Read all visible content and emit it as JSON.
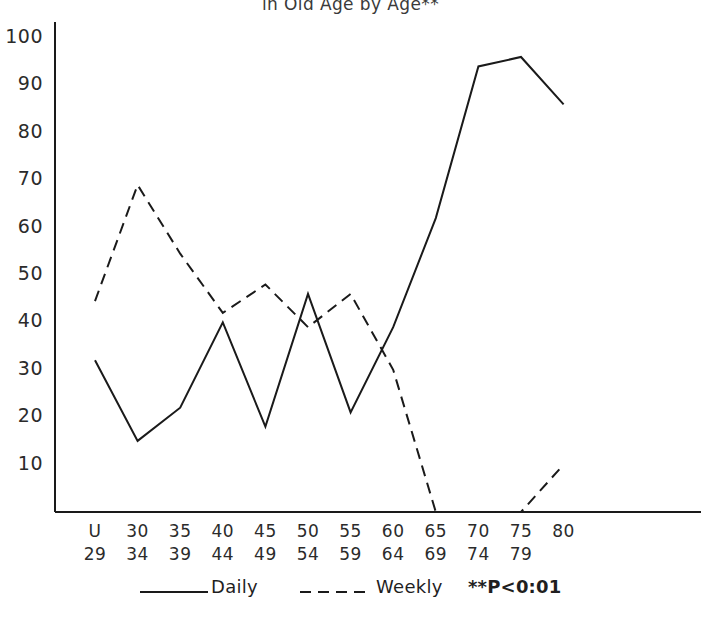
{
  "chart_data": {
    "type": "line",
    "title": "in Old Age by Age**",
    "xlabel": "",
    "ylabel": "",
    "ylim": [
      0,
      105
    ],
    "yticks": [
      10,
      20,
      30,
      40,
      50,
      60,
      70,
      80,
      90,
      100
    ],
    "grid": false,
    "legend_position": "bottom",
    "categories": [
      "U\n29",
      "30\n34",
      "35\n39",
      "40\n44",
      "45\n49",
      "50\n54",
      "55\n59",
      "60\n64",
      "65\n69",
      "70\n74",
      "75\n79",
      "80"
    ],
    "category_top": [
      "U",
      "30",
      "35",
      "40",
      "45",
      "50",
      "55",
      "60",
      "65",
      "70",
      "75",
      ""
    ],
    "category_bottom": [
      "29",
      "34",
      "39",
      "44",
      "49",
      "54",
      "59",
      "64",
      "69",
      "74",
      "79",
      "80"
    ],
    "series": [
      {
        "name": "Daily",
        "style": "solid",
        "color": "#1a1a1a",
        "values": [
          32,
          15,
          22,
          40,
          18,
          46,
          21,
          39,
          62,
          94,
          96,
          86
        ]
      },
      {
        "name": "Weekly",
        "style": "dashed",
        "color": "#1a1a1a",
        "values": [
          44.5,
          69,
          54.5,
          42,
          48,
          39,
          46,
          30,
          0,
          0,
          0,
          10
        ]
      }
    ],
    "annotations": [
      {
        "id": "significance-note",
        "text": "**P<0:01"
      }
    ]
  },
  "legend": {
    "items": [
      {
        "label": "Daily",
        "style": "solid"
      },
      {
        "label": "Weekly",
        "style": "dashed"
      }
    ],
    "note": "**P<0:01"
  },
  "axes": {
    "y_tick_labels": [
      "100",
      "90",
      "80",
      "70",
      "60",
      "50",
      "40",
      "30",
      "20",
      "10"
    ],
    "x_tick_top": [
      "U",
      "30",
      "35",
      "40",
      "45",
      "50",
      "55",
      "60",
      "65",
      "70",
      "75",
      ""
    ],
    "x_tick_bottom": [
      "29",
      "34",
      "39",
      "44",
      "49",
      "54",
      "59",
      "64",
      "69",
      "74",
      "79",
      "80"
    ]
  }
}
